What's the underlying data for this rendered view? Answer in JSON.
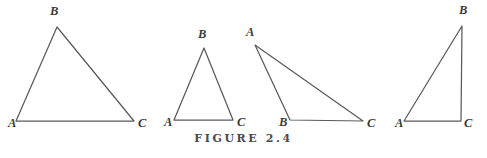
{
  "figure": {
    "caption": "FIGURE 2.4",
    "stroke_color": "#5a5a5a",
    "label_color": "#3b3b3b",
    "background_color": "#ffffff",
    "width": 487,
    "height": 158
  },
  "diagram_data": {
    "type": "geometry-diagram",
    "description": "Four labelled triangles ABC shown side by side",
    "shapes": [
      {
        "id": "triangle-1",
        "kind": "acute-scalene-triangle",
        "vertices": [
          {
            "label": "A",
            "x": 16,
            "y": 121,
            "label_x": 8,
            "label_y": 117
          },
          {
            "label": "B",
            "x": 57,
            "y": 27,
            "label_x": 50,
            "label_y": 5
          },
          {
            "label": "C",
            "x": 134,
            "y": 121,
            "label_x": 138,
            "label_y": 117
          }
        ]
      },
      {
        "id": "triangle-2",
        "kind": "isosceles-triangle",
        "vertices": [
          {
            "label": "A",
            "x": 174,
            "y": 120,
            "label_x": 164,
            "label_y": 116
          },
          {
            "label": "B",
            "x": 204,
            "y": 48,
            "label_x": 198,
            "label_y": 28
          },
          {
            "label": "C",
            "x": 233,
            "y": 120,
            "label_x": 237,
            "label_y": 116
          }
        ]
      },
      {
        "id": "triangle-3",
        "kind": "obtuse-triangle",
        "vertices": [
          {
            "label": "A",
            "x": 255,
            "y": 45,
            "label_x": 246,
            "label_y": 26
          },
          {
            "label": "B",
            "x": 290,
            "y": 120,
            "label_x": 279,
            "label_y": 116
          },
          {
            "label": "C",
            "x": 363,
            "y": 121,
            "label_x": 367,
            "label_y": 117
          }
        ]
      },
      {
        "id": "triangle-4",
        "kind": "right-triangle",
        "vertices": [
          {
            "label": "A",
            "x": 404,
            "y": 121,
            "label_x": 395,
            "label_y": 117
          },
          {
            "label": "B",
            "x": 462,
            "y": 26,
            "label_x": 459,
            "label_y": 4
          },
          {
            "label": "C",
            "x": 461,
            "y": 121,
            "label_x": 464,
            "label_y": 117
          }
        ]
      }
    ]
  }
}
